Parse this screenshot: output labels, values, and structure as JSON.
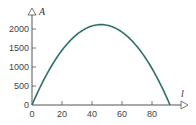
{
  "chart_data": {
    "type": "line",
    "title": "",
    "xlabel": "l",
    "ylabel": "A",
    "xlim": [
      0,
      100
    ],
    "ylim": [
      0,
      2300
    ],
    "xticks": [
      0,
      20,
      40,
      60,
      80
    ],
    "yticks": [
      0,
      500,
      1000,
      1500,
      2000
    ],
    "grid": false,
    "legend": null,
    "series": [
      {
        "name": "A(l)",
        "color": "#2f6f6b",
        "x": [
          0,
          5,
          10,
          15,
          20,
          25,
          30,
          35,
          40,
          46,
          50,
          55,
          60,
          65,
          70,
          75,
          80,
          85,
          92
        ],
        "values": [
          0,
          435,
          820,
          1155,
          1440,
          1675,
          1860,
          1995,
          2080,
          2116,
          2100,
          2035,
          1920,
          1755,
          1540,
          1275,
          960,
          595,
          0
        ]
      }
    ]
  },
  "colors": {
    "axis": "#555555",
    "curve": "#2f6f6b"
  }
}
